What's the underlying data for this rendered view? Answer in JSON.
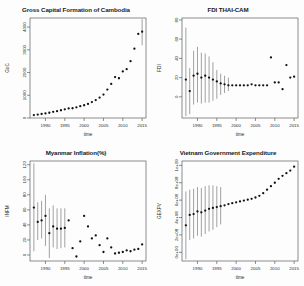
{
  "figure": {
    "layout": "2x2 panel grid",
    "background": "#fdfdfd",
    "point_color": "#111111",
    "errorbar_color": "#555555",
    "axis_color": "#444444"
  },
  "chart_data": [
    {
      "type": "scatter",
      "panel": "top-left",
      "title": "Gross Capital Formation of Cambodia",
      "xlabel": "time",
      "ylabel": "GoC",
      "xticks": [
        1990,
        1995,
        2000,
        2005,
        2010,
        2015
      ],
      "yticks": [
        0,
        1000,
        2000,
        3000,
        4000
      ],
      "xlim": [
        1986,
        2016
      ],
      "ylim": [
        0,
        4400
      ],
      "grid": false,
      "legend": "none",
      "errorbars": true,
      "x": [
        1987,
        1988,
        1989,
        1990,
        1991,
        1992,
        1993,
        1994,
        1995,
        1996,
        1997,
        1998,
        1999,
        2000,
        2001,
        2002,
        2003,
        2004,
        2005,
        2006,
        2007,
        2008,
        2009,
        2010,
        2011,
        2012,
        2013,
        2014,
        2015
      ],
      "values": [
        130,
        150,
        175,
        200,
        230,
        270,
        300,
        340,
        380,
        420,
        430,
        470,
        520,
        560,
        620,
        700,
        790,
        900,
        1030,
        1250,
        1500,
        1800,
        1750,
        2050,
        2150,
        2500,
        3050,
        3700,
        3800
      ],
      "err_low": [
        null,
        null,
        null,
        null,
        null,
        null,
        null,
        null,
        null,
        null,
        null,
        null,
        null,
        null,
        null,
        null,
        null,
        null,
        null,
        null,
        null,
        null,
        null,
        null,
        null,
        null,
        null,
        null,
        3200
      ],
      "err_high": [
        null,
        null,
        null,
        null,
        null,
        null,
        null,
        null,
        null,
        null,
        null,
        null,
        null,
        null,
        null,
        null,
        null,
        null,
        null,
        null,
        null,
        null,
        null,
        null,
        null,
        null,
        null,
        null,
        4350
      ]
    },
    {
      "type": "scatter",
      "panel": "top-right",
      "title": "FDI THAI-CAM",
      "xlabel": "time",
      "ylabel": "FDI",
      "xticks": [
        1990,
        1995,
        2000,
        2005,
        2010,
        2015
      ],
      "yticks": [
        0,
        20,
        40,
        60,
        80
      ],
      "xlim": [
        1986,
        2016
      ],
      "ylim": [
        -22,
        82
      ],
      "grid": false,
      "legend": "none",
      "errorbars": true,
      "x": [
        1987,
        1988,
        1989,
        1990,
        1991,
        1992,
        1993,
        1994,
        1995,
        1996,
        1997,
        1998,
        1999,
        2000,
        2001,
        2002,
        2003,
        2004,
        2005,
        2006,
        2007,
        2008,
        2009,
        2010,
        2011,
        2012,
        2013,
        2014,
        2015
      ],
      "values": [
        18,
        6,
        22,
        24,
        20,
        22,
        20,
        18,
        16,
        14,
        13,
        12,
        12,
        12,
        12,
        12,
        12,
        13,
        12,
        12,
        12,
        12,
        41,
        15,
        15,
        8,
        33,
        20,
        21,
        12
      ],
      "err_low": [
        -20,
        -18,
        -8,
        -6,
        -7,
        -6,
        -6,
        -4,
        -2,
        2,
        4,
        6,
        null,
        null,
        null,
        null,
        null,
        null,
        null,
        null,
        null,
        null,
        null,
        null,
        null,
        null,
        null,
        null,
        null
      ],
      "err_high": [
        72,
        30,
        48,
        52,
        46,
        45,
        42,
        36,
        28,
        24,
        22,
        20,
        null,
        null,
        null,
        null,
        null,
        null,
        null,
        null,
        null,
        null,
        null,
        null,
        null,
        null,
        null,
        null,
        null
      ]
    },
    {
      "type": "scatter",
      "panel": "bottom-left",
      "title": "Myanmar Inflation(%)",
      "xlabel": "time",
      "ylabel": "INFM",
      "xticks": [
        1990,
        1995,
        2000,
        2005,
        2010,
        2015
      ],
      "yticks": [
        0,
        20,
        40,
        60,
        80,
        100,
        120
      ],
      "xlim": [
        1986,
        2016
      ],
      "ylim": [
        -8,
        125
      ],
      "grid": false,
      "legend": "none",
      "errorbars": true,
      "x": [
        1987,
        1988,
        1989,
        1990,
        1991,
        1992,
        1993,
        1994,
        1995,
        1996,
        1997,
        1998,
        1999,
        2000,
        2001,
        2002,
        2003,
        2004,
        2005,
        2006,
        2007,
        2008,
        2009,
        2010,
        2011,
        2012,
        2013,
        2014,
        2015
      ],
      "values": [
        63,
        44,
        46,
        52,
        29,
        38,
        35,
        35,
        36,
        46,
        9,
        -2,
        18,
        52,
        38,
        22,
        26,
        13,
        4,
        22,
        10,
        2,
        3,
        4,
        6,
        5,
        7,
        8,
        14
      ],
      "err_low": [
        5,
        20,
        22,
        12,
        -4,
        10,
        8,
        9,
        10,
        null,
        null,
        null,
        null,
        null,
        null,
        null,
        null,
        null,
        null,
        null,
        null,
        null,
        null,
        null,
        null,
        null,
        null,
        null,
        null
      ],
      "err_high": [
        122,
        70,
        72,
        80,
        62,
        66,
        62,
        62,
        62,
        null,
        null,
        null,
        null,
        null,
        null,
        null,
        null,
        null,
        null,
        null,
        null,
        null,
        null,
        null,
        null,
        null,
        null,
        null,
        null
      ]
    },
    {
      "type": "scatter",
      "panel": "bottom-right",
      "title": "Vietnam Government Expenditure",
      "xlabel": "time",
      "ylabel": "GEXPV",
      "xticks": [
        1990,
        1995,
        2000,
        2005,
        2010,
        2015
      ],
      "yticks": [
        "0e+00",
        "2e+08",
        "4e+08",
        "6e+08",
        "8e+08",
        "1e+09"
      ],
      "ytick_values": [
        0,
        200000000,
        400000000,
        600000000,
        800000000,
        1000000000
      ],
      "xlim": [
        1986,
        2016
      ],
      "ylim": [
        -100000000,
        1050000000
      ],
      "grid": false,
      "legend": "none",
      "errorbars": true,
      "x": [
        1987,
        1988,
        1989,
        1990,
        1991,
        1992,
        1993,
        1994,
        1995,
        1996,
        1997,
        1998,
        1999,
        2000,
        2001,
        2002,
        2003,
        2004,
        2005,
        2006,
        2007,
        2008,
        2009,
        2010,
        2011,
        2012,
        2013,
        2014,
        2015
      ],
      "values": [
        310000000,
        430000000,
        440000000,
        470000000,
        460000000,
        480000000,
        500000000,
        510000000,
        520000000,
        530000000,
        540000000,
        555000000,
        565000000,
        575000000,
        585000000,
        595000000,
        605000000,
        615000000,
        630000000,
        650000000,
        680000000,
        720000000,
        760000000,
        800000000,
        845000000,
        880000000,
        910000000,
        940000000,
        985000000
      ],
      "err_low": [
        -80000000,
        140000000,
        160000000,
        190000000,
        180000000,
        210000000,
        240000000,
        260000000,
        290000000,
        320000000,
        null,
        null,
        null,
        null,
        null,
        null,
        null,
        null,
        null,
        null,
        null,
        null,
        null,
        null,
        null,
        null,
        null,
        null,
        null
      ],
      "err_high": [
        700000000,
        720000000,
        730000000,
        750000000,
        740000000,
        760000000,
        770000000,
        770000000,
        760000000,
        750000000,
        null,
        null,
        null,
        null,
        null,
        null,
        null,
        null,
        null,
        null,
        null,
        null,
        null,
        null,
        null,
        null,
        null,
        null,
        null
      ]
    }
  ]
}
